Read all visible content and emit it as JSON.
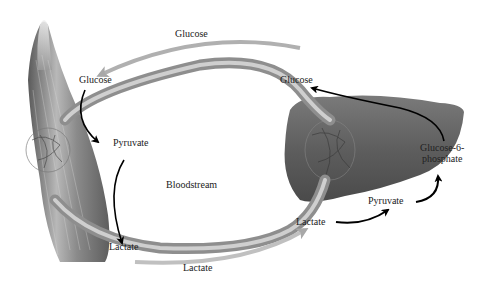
{
  "diagram": {
    "type": "Cori cycle",
    "nodes": {
      "muscle": {
        "name": "muscle"
      },
      "liver": {
        "name": "liver"
      },
      "bloodstream": {
        "name": "bloodstream"
      }
    },
    "labels": {
      "glucose_top": "Glucose",
      "glucose_muscle": "Glucose",
      "glucose_liver": "Glucose",
      "pyruvate_muscle": "Pyruvate",
      "bloodstream": "Bloodstream",
      "lactate_muscle": "Lactate",
      "lactate_bottom": "Lactate",
      "lactate_liver": "Lactate",
      "pyruvate_liver": "Pyruvate",
      "g6p_line1": "Glucose-6-",
      "g6p_line2": "phosphate"
    },
    "edges": [
      {
        "from": "liver",
        "to": "muscle",
        "label": "Glucose",
        "via": "bloodstream"
      },
      {
        "from": "Glucose",
        "to": "Pyruvate",
        "location": "muscle"
      },
      {
        "from": "Pyruvate",
        "to": "Lactate",
        "location": "muscle"
      },
      {
        "from": "muscle",
        "to": "liver",
        "label": "Lactate",
        "via": "bloodstream"
      },
      {
        "from": "Lactate",
        "to": "Pyruvate",
        "location": "liver"
      },
      {
        "from": "Pyruvate",
        "to": "Glucose-6-phosphate",
        "location": "liver"
      },
      {
        "from": "Glucose-6-phosphate",
        "to": "Glucose",
        "location": "liver"
      }
    ],
    "colors": {
      "vessel": "#9a9a9a",
      "vessel_highlight": "#c8c8c8",
      "flow_arrow": "#b0b0b0",
      "reaction_arrow": "#000000",
      "organ": "#6e6e6e"
    }
  }
}
